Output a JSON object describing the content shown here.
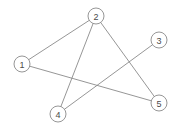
{
  "figure": {
    "width": 180,
    "height": 131,
    "background_color": "#ffffff",
    "stroke_color": "#8a8a8a",
    "label_color": "#4a4a4a"
  },
  "graph_data": {
    "type": "node-link-diagram",
    "directed": false,
    "node_radius": 8,
    "node_count": 5,
    "edge_count": 5,
    "nodes": [
      {
        "id": "1",
        "label": "1",
        "x": 22,
        "y": 64,
        "degree": 2
      },
      {
        "id": "2",
        "label": "2",
        "x": 96,
        "y": 16,
        "degree": 3
      },
      {
        "id": "3",
        "label": "3",
        "x": 159,
        "y": 40,
        "degree": 1
      },
      {
        "id": "4",
        "label": "4",
        "x": 58,
        "y": 114,
        "degree": 2
      },
      {
        "id": "5",
        "label": "5",
        "x": 159,
        "y": 103,
        "degree": 2
      }
    ],
    "edges": [
      {
        "id": "edge-1-2",
        "source": "1",
        "target": "2"
      },
      {
        "id": "edge-1-5",
        "source": "1",
        "target": "5"
      },
      {
        "id": "edge-2-4",
        "source": "2",
        "target": "4"
      },
      {
        "id": "edge-2-5",
        "source": "2",
        "target": "5"
      },
      {
        "id": "edge-3-4",
        "source": "3",
        "target": "4"
      }
    ]
  }
}
